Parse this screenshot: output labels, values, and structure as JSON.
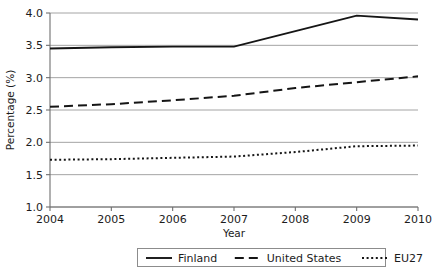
{
  "chart_data": {
    "type": "line",
    "title": "",
    "xlabel": "Year",
    "ylabel": "Percentage (%)",
    "x": [
      2004,
      2005,
      2006,
      2007,
      2008,
      2009,
      2010
    ],
    "xticklabels": [
      "2004",
      "2005",
      "2006",
      "2007",
      "2008",
      "2009",
      "2010"
    ],
    "yticklabels": [
      "1.0",
      "1.5",
      "2.0",
      "2.5",
      "3.0",
      "3.5",
      "4.0"
    ],
    "yticks": [
      1.0,
      1.5,
      2.0,
      2.5,
      3.0,
      3.5,
      4.0
    ],
    "xlim": [
      2004,
      2010
    ],
    "ylim": [
      1.0,
      4.0
    ],
    "grid": true,
    "legend_position": "bottom-center",
    "series": [
      {
        "name": "Finland",
        "style": "solid",
        "color": "#151515",
        "values": [
          3.45,
          3.47,
          3.48,
          3.48,
          3.72,
          3.96,
          3.9
        ]
      },
      {
        "name": "United States",
        "style": "dashed",
        "color": "#151515",
        "values": [
          2.55,
          2.59,
          2.65,
          2.72,
          2.84,
          2.93,
          3.02
        ]
      },
      {
        "name": "EU27",
        "style": "dotted",
        "color": "#151515",
        "values": [
          1.73,
          1.74,
          1.76,
          1.78,
          1.85,
          1.94,
          1.95
        ]
      }
    ]
  },
  "legend": {
    "items": [
      {
        "label": "Finland",
        "style": "solid"
      },
      {
        "label": "United States",
        "style": "dashed"
      },
      {
        "label": "EU27",
        "style": "dotted"
      }
    ]
  }
}
